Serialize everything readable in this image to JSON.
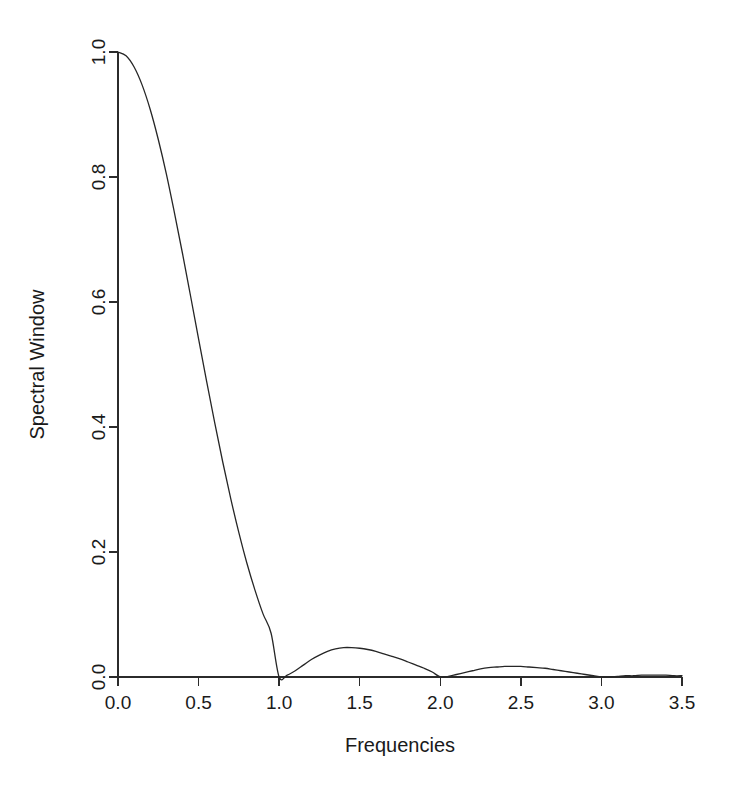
{
  "chart_data": {
    "type": "line",
    "title": "",
    "xlabel": "Frequencies",
    "ylabel": "Spectral Window",
    "xlim": [
      0,
      3.5
    ],
    "ylim": [
      0,
      1.0
    ],
    "xticks": [
      0.0,
      0.5,
      1.0,
      1.5,
      2.0,
      2.5,
      3.0,
      3.5
    ],
    "xticklabels": [
      "0.0",
      "0.5",
      "1.0",
      "1.5",
      "2.0",
      "2.5",
      "3.0",
      "3.5"
    ],
    "yticks": [
      0.0,
      0.2,
      0.4,
      0.6,
      0.8,
      1.0
    ],
    "yticklabels": [
      "0.0",
      "0.2",
      "0.4",
      "0.6",
      "0.8",
      "1.0"
    ],
    "grid": false,
    "legend": false,
    "line_color": "#262626",
    "background_color": "#ffffff",
    "axis_color": "#2b2b2b",
    "series": [
      {
        "name": "Spectral Window",
        "annotations": {
          "main_lobe_peak_x": 0.0,
          "main_lobe_peak_y": 1.0,
          "half_power_x": 0.44,
          "first_null_x": 1.0,
          "second_null_x": 2.0,
          "third_null_x": 3.0,
          "sidelobe_1_x": 1.46,
          "sidelobe_1_y": 0.047,
          "sidelobe_2_x": 2.48,
          "sidelobe_2_y": 0.017
        },
        "x": [
          0.0,
          0.05,
          0.1,
          0.15,
          0.2,
          0.25,
          0.3,
          0.35,
          0.4,
          0.45,
          0.5,
          0.55,
          0.6,
          0.65,
          0.7,
          0.75,
          0.8,
          0.85,
          0.9,
          0.95,
          1.0,
          1.05,
          1.1,
          1.15,
          1.2,
          1.25,
          1.3,
          1.35,
          1.4,
          1.45,
          1.5,
          1.55,
          1.6,
          1.65,
          1.7,
          1.75,
          1.8,
          1.85,
          1.9,
          1.95,
          2.0,
          2.05,
          2.1,
          2.15,
          2.2,
          2.25,
          2.3,
          2.35,
          2.4,
          2.45,
          2.5,
          2.55,
          2.6,
          2.65,
          2.7,
          2.75,
          2.8,
          2.85,
          2.9,
          2.95,
          3.0,
          3.05,
          3.1,
          3.15,
          3.2,
          3.25,
          3.3,
          3.35,
          3.4,
          3.45,
          3.5
        ],
        "y": [
          1.0,
          0.994,
          0.976,
          0.947,
          0.908,
          0.86,
          0.805,
          0.743,
          0.678,
          0.61,
          0.541,
          0.473,
          0.407,
          0.344,
          0.285,
          0.231,
          0.182,
          0.139,
          0.101,
          0.07,
          0.0,
          0.003,
          0.01,
          0.019,
          0.028,
          0.035,
          0.041,
          0.045,
          0.047,
          0.047,
          0.046,
          0.044,
          0.041,
          0.037,
          0.033,
          0.029,
          0.024,
          0.019,
          0.014,
          0.008,
          0.0,
          0.001,
          0.004,
          0.007,
          0.01,
          0.013,
          0.015,
          0.016,
          0.017,
          0.017,
          0.017,
          0.016,
          0.015,
          0.014,
          0.012,
          0.01,
          0.008,
          0.006,
          0.004,
          0.002,
          0.0,
          0.0,
          0.001,
          0.002,
          0.002,
          0.003,
          0.003,
          0.003,
          0.003,
          0.002,
          0.002
        ]
      }
    ]
  },
  "plot_geometry": {
    "left_px": 118,
    "right_px": 682,
    "top_px": 52,
    "bottom_px": 677,
    "tick_length_px": 9,
    "xlabel_y_px": 752,
    "ylabel_x_px": 44
  }
}
